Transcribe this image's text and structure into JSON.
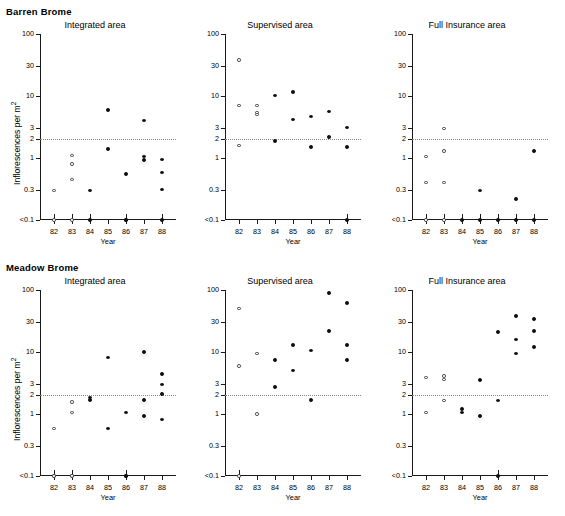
{
  "figure": {
    "groups": [
      {
        "id": "barren",
        "label": "Barren Brome"
      },
      {
        "id": "meadow",
        "label": "Meadow Brome"
      }
    ],
    "axis": {
      "ylabel": "Inflorescences per m",
      "ylabel_superscript": "2",
      "xlabel": "Year",
      "ytick_labels": [
        "100",
        "30",
        "10",
        "3",
        "2",
        "1",
        "0.3",
        "<0.1"
      ],
      "ytick_values": [
        100,
        30,
        10,
        3,
        2,
        1,
        0.3,
        0.1
      ],
      "xtick_labels": [
        "82",
        "83",
        "84",
        "85",
        "86",
        "87",
        "88"
      ],
      "xtick_values": [
        82,
        83,
        84,
        85,
        86,
        87,
        88
      ]
    },
    "threshold": {
      "value": 2,
      "style": "dotted",
      "color": "#8a8a8a"
    },
    "marker_legend": {
      "open": "pre-treatment year (open circle)",
      "filled": "treatment year (filled circle)"
    },
    "panel_titles": [
      "Integrated area",
      "Supervised area",
      "Full Insurance area"
    ]
  },
  "chart_data": [
    {
      "id": "barren-integrated",
      "type": "scatter",
      "title": "Integrated area",
      "group": "Barren Brome",
      "xlabel": "Year",
      "ylabel": "Inflorescences per m2",
      "yscale": "log",
      "ylim": [
        0.1,
        100
      ],
      "xlim": [
        81.5,
        88.8
      ],
      "grid": false,
      "threshold": 2,
      "points": [
        {
          "x": 82,
          "y": 0.3,
          "style": "open"
        },
        {
          "x": 82,
          "y": 0.1,
          "style": "open"
        },
        {
          "x": 83,
          "y": 1.1,
          "style": "open"
        },
        {
          "x": 83,
          "y": 0.8,
          "style": "open"
        },
        {
          "x": 83,
          "y": 0.45,
          "style": "open"
        },
        {
          "x": 83,
          "y": 0.1,
          "style": "open"
        },
        {
          "x": 84,
          "y": 0.3,
          "style": "filled"
        },
        {
          "x": 84,
          "y": 0.1,
          "style": "filled"
        },
        {
          "x": 85,
          "y": 6.0,
          "style": "filled"
        },
        {
          "x": 85,
          "y": 1.4,
          "style": "filled"
        },
        {
          "x": 86,
          "y": 0.55,
          "style": "filled"
        },
        {
          "x": 86,
          "y": 0.1,
          "style": "filled"
        },
        {
          "x": 86,
          "y": 0.1,
          "style": "filled"
        },
        {
          "x": 87,
          "y": 4.0,
          "style": "filled"
        },
        {
          "x": 87,
          "y": 1.05,
          "style": "filled"
        },
        {
          "x": 87,
          "y": 0.92,
          "style": "filled"
        },
        {
          "x": 88,
          "y": 0.95,
          "style": "filled"
        },
        {
          "x": 88,
          "y": 0.58,
          "style": "filled"
        },
        {
          "x": 88,
          "y": 0.31,
          "style": "filled"
        },
        {
          "x": 88,
          "y": 0.1,
          "style": "filled"
        }
      ]
    },
    {
      "id": "barren-supervised",
      "type": "scatter",
      "title": "Supervised area",
      "group": "Barren Brome",
      "xlabel": "Year",
      "ylabel": "Inflorescences per m2",
      "yscale": "log",
      "ylim": [
        0.1,
        100
      ],
      "xlim": [
        81.5,
        88.8
      ],
      "grid": false,
      "threshold": 2,
      "points": [
        {
          "x": 82,
          "y": 38.0,
          "style": "open"
        },
        {
          "x": 82,
          "y": 7.0,
          "style": "open"
        },
        {
          "x": 82,
          "y": 1.6,
          "style": "open"
        },
        {
          "x": 83,
          "y": 7.0,
          "style": "open"
        },
        {
          "x": 83,
          "y": 5.4,
          "style": "open"
        },
        {
          "x": 83,
          "y": 5.0,
          "style": "open"
        },
        {
          "x": 84,
          "y": 10.2,
          "style": "filled"
        },
        {
          "x": 84,
          "y": 1.9,
          "style": "filled"
        },
        {
          "x": 85,
          "y": 11.5,
          "style": "filled"
        },
        {
          "x": 85,
          "y": 4.2,
          "style": "filled"
        },
        {
          "x": 86,
          "y": 4.7,
          "style": "filled"
        },
        {
          "x": 86,
          "y": 1.5,
          "style": "filled"
        },
        {
          "x": 87,
          "y": 5.6,
          "style": "filled"
        },
        {
          "x": 87,
          "y": 2.2,
          "style": "filled"
        },
        {
          "x": 88,
          "y": 3.1,
          "style": "filled"
        },
        {
          "x": 88,
          "y": 1.5,
          "style": "filled"
        },
        {
          "x": 88,
          "y": 0.1,
          "style": "filled"
        }
      ]
    },
    {
      "id": "barren-full-insurance",
      "type": "scatter",
      "title": "Full Insurance area",
      "group": "Barren Brome",
      "xlabel": "Year",
      "ylabel": "Inflorescences per m2",
      "yscale": "log",
      "ylim": [
        0.1,
        100
      ],
      "xlim": [
        81.5,
        88.8
      ],
      "grid": false,
      "threshold": 2,
      "points": [
        {
          "x": 82,
          "y": 1.05,
          "style": "open"
        },
        {
          "x": 82,
          "y": 0.4,
          "style": "open"
        },
        {
          "x": 82,
          "y": 0.1,
          "style": "open"
        },
        {
          "x": 83,
          "y": 3.0,
          "style": "open"
        },
        {
          "x": 83,
          "y": 1.3,
          "style": "open"
        },
        {
          "x": 83,
          "y": 0.4,
          "style": "open"
        },
        {
          "x": 83,
          "y": 0.1,
          "style": "open"
        },
        {
          "x": 84,
          "y": 0.1,
          "style": "filled"
        },
        {
          "x": 85,
          "y": 0.3,
          "style": "filled"
        },
        {
          "x": 85,
          "y": 0.1,
          "style": "filled"
        },
        {
          "x": 86,
          "y": 0.1,
          "style": "filled"
        },
        {
          "x": 87,
          "y": 0.22,
          "style": "filled"
        },
        {
          "x": 87,
          "y": 0.1,
          "style": "filled"
        },
        {
          "x": 88,
          "y": 1.3,
          "style": "filled"
        },
        {
          "x": 88,
          "y": 0.1,
          "style": "filled"
        }
      ]
    },
    {
      "id": "meadow-integrated",
      "type": "scatter",
      "title": "Integrated area",
      "group": "Meadow Brome",
      "xlabel": "Year",
      "ylabel": "Inflorescences per m2",
      "yscale": "log",
      "ylim": [
        0.1,
        100
      ],
      "xlim": [
        81.5,
        88.8
      ],
      "grid": false,
      "threshold": 2,
      "points": [
        {
          "x": 82,
          "y": 0.58,
          "style": "open"
        },
        {
          "x": 82,
          "y": 0.1,
          "style": "open"
        },
        {
          "x": 82,
          "y": 0.1,
          "style": "open"
        },
        {
          "x": 83,
          "y": 1.55,
          "style": "open"
        },
        {
          "x": 83,
          "y": 1.05,
          "style": "open"
        },
        {
          "x": 83,
          "y": 0.1,
          "style": "open"
        },
        {
          "x": 83,
          "y": 0.1,
          "style": "open"
        },
        {
          "x": 84,
          "y": 1.85,
          "style": "filled"
        },
        {
          "x": 84,
          "y": 1.7,
          "style": "filled"
        },
        {
          "x": 85,
          "y": 8.2,
          "style": "filled"
        },
        {
          "x": 85,
          "y": 0.58,
          "style": "filled"
        },
        {
          "x": 86,
          "y": 1.05,
          "style": "filled"
        },
        {
          "x": 86,
          "y": 0.1,
          "style": "filled"
        },
        {
          "x": 86,
          "y": 0.1,
          "style": "filled"
        },
        {
          "x": 87,
          "y": 10.0,
          "style": "filled"
        },
        {
          "x": 87,
          "y": 1.7,
          "style": "filled"
        },
        {
          "x": 87,
          "y": 0.92,
          "style": "filled"
        },
        {
          "x": 88,
          "y": 4.4,
          "style": "filled"
        },
        {
          "x": 88,
          "y": 3.0,
          "style": "filled"
        },
        {
          "x": 88,
          "y": 2.1,
          "style": "filled"
        },
        {
          "x": 88,
          "y": 0.82,
          "style": "filled"
        }
      ]
    },
    {
      "id": "meadow-supervised",
      "type": "scatter",
      "title": "Supervised area",
      "group": "Meadow Brome",
      "xlabel": "Year",
      "ylabel": "Inflorescences per m2",
      "yscale": "log",
      "ylim": [
        0.1,
        100
      ],
      "xlim": [
        81.5,
        88.8
      ],
      "grid": false,
      "threshold": 2,
      "points": [
        {
          "x": 82,
          "y": 50.0,
          "style": "open"
        },
        {
          "x": 82,
          "y": 6.0,
          "style": "open"
        },
        {
          "x": 82,
          "y": 0.1,
          "style": "open"
        },
        {
          "x": 83,
          "y": 9.5,
          "style": "open"
        },
        {
          "x": 83,
          "y": 1.0,
          "style": "open"
        },
        {
          "x": 84,
          "y": 7.5,
          "style": "filled"
        },
        {
          "x": 84,
          "y": 2.7,
          "style": "filled"
        },
        {
          "x": 85,
          "y": 13.0,
          "style": "filled"
        },
        {
          "x": 85,
          "y": 5.0,
          "style": "filled"
        },
        {
          "x": 86,
          "y": 10.5,
          "style": "filled"
        },
        {
          "x": 86,
          "y": 1.7,
          "style": "filled"
        },
        {
          "x": 87,
          "y": 90.0,
          "style": "filled"
        },
        {
          "x": 87,
          "y": 22.0,
          "style": "filled"
        },
        {
          "x": 88,
          "y": 62.0,
          "style": "filled"
        },
        {
          "x": 88,
          "y": 13.0,
          "style": "filled"
        },
        {
          "x": 88,
          "y": 7.5,
          "style": "filled"
        }
      ]
    },
    {
      "id": "meadow-full-insurance",
      "type": "scatter",
      "title": "Full Insurance area",
      "group": "Meadow Brome",
      "xlabel": "Year",
      "ylabel": "Inflorescences per m2",
      "yscale": "log",
      "ylim": [
        0.1,
        100
      ],
      "xlim": [
        81.5,
        88.8
      ],
      "grid": false,
      "threshold": 2,
      "points": [
        {
          "x": 82,
          "y": 3.9,
          "style": "open"
        },
        {
          "x": 82,
          "y": 1.05,
          "style": "open"
        },
        {
          "x": 83,
          "y": 4.1,
          "style": "open"
        },
        {
          "x": 83,
          "y": 3.6,
          "style": "open"
        },
        {
          "x": 83,
          "y": 1.65,
          "style": "open"
        },
        {
          "x": 84,
          "y": 1.2,
          "style": "filled"
        },
        {
          "x": 84,
          "y": 1.05,
          "style": "filled"
        },
        {
          "x": 85,
          "y": 3.5,
          "style": "filled"
        },
        {
          "x": 85,
          "y": 0.92,
          "style": "filled"
        },
        {
          "x": 86,
          "y": 21.0,
          "style": "filled"
        },
        {
          "x": 86,
          "y": 1.65,
          "style": "filled"
        },
        {
          "x": 86,
          "y": 0.1,
          "style": "filled"
        },
        {
          "x": 87,
          "y": 38.0,
          "style": "filled"
        },
        {
          "x": 87,
          "y": 16.0,
          "style": "filled"
        },
        {
          "x": 87,
          "y": 9.5,
          "style": "filled"
        },
        {
          "x": 88,
          "y": 34.0,
          "style": "filled"
        },
        {
          "x": 88,
          "y": 22.0,
          "style": "filled"
        },
        {
          "x": 88,
          "y": 12.0,
          "style": "filled"
        }
      ]
    }
  ]
}
